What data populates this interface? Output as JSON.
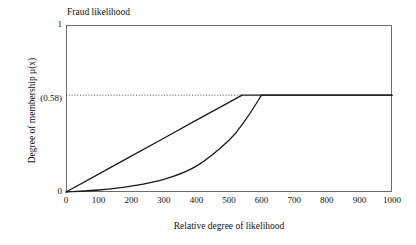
{
  "chart_data": {
    "type": "line",
    "title": "Fraud likelihood",
    "xlabel": "Relative degree of likelihood",
    "ylabel": "Degree of membership μ(x)",
    "xlim": [
      0,
      1000
    ],
    "ylim": [
      0,
      1
    ],
    "grid": false,
    "legend": "none",
    "xticks": [
      0,
      100,
      200,
      300,
      400,
      500,
      600,
      700,
      800,
      900,
      1000
    ],
    "xtick_labels": [
      "0",
      "100",
      "200",
      "300",
      "400",
      "500",
      "600",
      "700",
      "800",
      "900",
      "1000"
    ],
    "ytick_labels": [
      "1",
      "(0.58)",
      "0"
    ],
    "ytick_values": [
      1,
      0.58,
      0
    ],
    "plateau_value": 0.58,
    "annotations": [
      {
        "name": "membership-threshold-dotted-line",
        "type": "horizontal-dotted-line",
        "y": 0.58,
        "x_start": 0,
        "x_end": 540,
        "label": "(0.58)"
      }
    ],
    "series": [
      {
        "name": "linear-membership-curve",
        "shape": "linear-ramp-then-plateau",
        "color": "#1a1a1a",
        "breakpoint_x": 540,
        "points": [
          {
            "x": 0,
            "y": 0.0
          },
          {
            "x": 100,
            "y": 0.107
          },
          {
            "x": 200,
            "y": 0.215
          },
          {
            "x": 300,
            "y": 0.322
          },
          {
            "x": 400,
            "y": 0.43
          },
          {
            "x": 500,
            "y": 0.537
          },
          {
            "x": 540,
            "y": 0.58
          },
          {
            "x": 600,
            "y": 0.58
          },
          {
            "x": 700,
            "y": 0.58
          },
          {
            "x": 800,
            "y": 0.58
          },
          {
            "x": 900,
            "y": 0.58
          },
          {
            "x": 1000,
            "y": 0.58
          }
        ]
      },
      {
        "name": "convex-membership-curve",
        "shape": "convex-rise-then-plateau",
        "color": "#1a1a1a",
        "breakpoint_x": 600,
        "points": [
          {
            "x": 0,
            "y": 0.0
          },
          {
            "x": 100,
            "y": 0.012
          },
          {
            "x": 200,
            "y": 0.035
          },
          {
            "x": 300,
            "y": 0.075
          },
          {
            "x": 400,
            "y": 0.155
          },
          {
            "x": 500,
            "y": 0.31
          },
          {
            "x": 550,
            "y": 0.43
          },
          {
            "x": 600,
            "y": 0.58
          },
          {
            "x": 700,
            "y": 0.58
          },
          {
            "x": 800,
            "y": 0.58
          },
          {
            "x": 900,
            "y": 0.58
          },
          {
            "x": 1000,
            "y": 0.58
          }
        ]
      }
    ]
  }
}
